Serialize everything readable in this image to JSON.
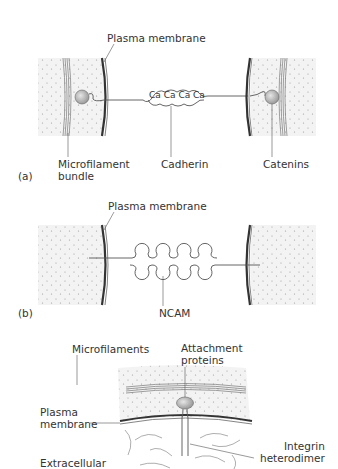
{
  "panels": [
    {
      "id": "a",
      "tag": "(a)",
      "labels": {
        "plasma_membrane": "Plasma membrane",
        "microfilament_line1": "Microfilament",
        "microfilament_line2": "bundle",
        "cadherin": "Cadherin",
        "catenins": "Catenins"
      },
      "calcium_ions": [
        "Ca",
        "Ca",
        "Ca",
        "Ca"
      ]
    },
    {
      "id": "b",
      "tag": "(b)",
      "labels": {
        "plasma_membrane": "Plasma membrane",
        "ncam": "NCAM"
      }
    },
    {
      "id": "c",
      "tag": "",
      "labels": {
        "microfilaments": "Microfilaments",
        "attachment_line1": "Attachment",
        "attachment_line2": "proteins",
        "plasma_line1": "Plasma",
        "plasma_line2": "membrane",
        "integrin_line1": "Integrin",
        "integrin_line2": "heterodimer",
        "extracellular": "Extracellular"
      }
    }
  ],
  "colors": {
    "line": "#555555",
    "membrane": "#333333",
    "cytoplasm": "#f0f0f0",
    "dots": "#999999",
    "protein": "#c8c8c8"
  }
}
